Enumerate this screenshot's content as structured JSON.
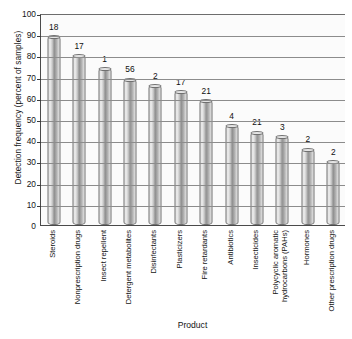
{
  "chart_data": {
    "type": "bar",
    "title": "",
    "xlabel": "Product",
    "ylabel": "Detection frequency (percent of samples)",
    "ylim": [
      0,
      100
    ],
    "ytick_step": 10,
    "yticks": [
      0,
      10,
      20,
      30,
      40,
      50,
      60,
      70,
      80,
      90,
      100
    ],
    "grid": true,
    "legend": "none",
    "categories": [
      "Steroids",
      "Nonprescription drugs",
      "Insect repellent",
      "Detergent metabolites",
      "Disinfectants",
      "Plasticizers",
      "Fire retardants",
      "Antibiotics",
      "Insecticides",
      "Polycyclic aromatic hydrocarbons (PAHs)",
      "Hormones",
      "Other prescription drugs"
    ],
    "values": [
      89,
      80,
      74,
      69,
      66,
      63,
      59,
      47,
      44,
      42,
      36,
      30
    ],
    "point_labels": [
      "18",
      "17",
      "1",
      "56",
      "2",
      "17",
      "21",
      "4",
      "21",
      "3",
      "2",
      "2"
    ],
    "point_labels_meaning": "number of compounds measured"
  },
  "axis": {
    "y_title": "Detection frequency (percent of samples)",
    "x_title": "Product"
  }
}
